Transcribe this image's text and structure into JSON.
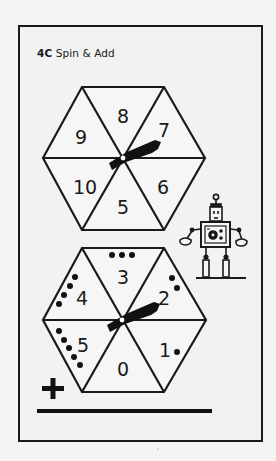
{
  "worksheet": {
    "code": "4C",
    "title": "Spin & Add"
  },
  "spinners": [
    {
      "name": "top-spinner",
      "segments": [
        {
          "position": "top",
          "label": "8",
          "dots": 0
        },
        {
          "position": "top-right",
          "label": "7",
          "dots": 0
        },
        {
          "position": "bottom-right",
          "label": "6",
          "dots": 0
        },
        {
          "position": "bottom",
          "label": "5",
          "dots": 0
        },
        {
          "position": "bottom-left",
          "label": "10",
          "dots": 0
        },
        {
          "position": "top-left",
          "label": "9",
          "dots": 0
        }
      ]
    },
    {
      "name": "bottom-spinner",
      "segments": [
        {
          "position": "top",
          "label": "3",
          "dots": 3
        },
        {
          "position": "top-right",
          "label": "2",
          "dots": 2
        },
        {
          "position": "bottom-right",
          "label": "1",
          "dots": 1
        },
        {
          "position": "bottom",
          "label": "0",
          "dots": 0
        },
        {
          "position": "bottom-left",
          "label": "5",
          "dots": 5
        },
        {
          "position": "top-left",
          "label": "4",
          "dots": 4
        }
      ]
    }
  ],
  "operator": "+",
  "answer_line": "",
  "colors": {
    "ink": "#1a1a1a",
    "paper": "#f2f2f2",
    "background": "#f4f4f4"
  },
  "icons": [
    "spinner-arrow-icon",
    "robot-icon",
    "plus-icon"
  ]
}
